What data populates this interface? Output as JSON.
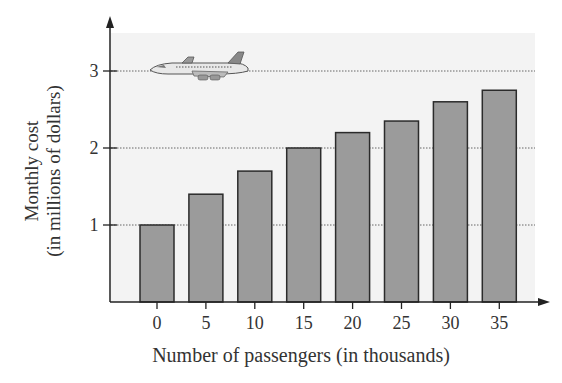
{
  "chart_data": {
    "type": "bar",
    "title": "",
    "xlabel": "Number of passengers (in thousands)",
    "ylabel": "Monthly cost (in millions of dollars)",
    "ylabel_lines": [
      "Monthly cost",
      "(in millions of dollars)"
    ],
    "categories": [
      "0",
      "5",
      "10",
      "15",
      "20",
      "25",
      "30",
      "35"
    ],
    "values": [
      1.0,
      1.4,
      1.7,
      2.0,
      2.2,
      2.35,
      2.6,
      2.75
    ],
    "yticks": [
      1,
      2,
      3
    ],
    "ylim": [
      0,
      3.5
    ],
    "grid": "horizontal dotted at y ticks",
    "legend": null,
    "annotations": [
      "airplane illustration near y=3"
    ],
    "colors": {
      "bar_fill": "#9b9b9b",
      "bar_edge": "#2b2b2b",
      "plot_bg": "#f3f3f3",
      "axis": "#222222"
    }
  }
}
